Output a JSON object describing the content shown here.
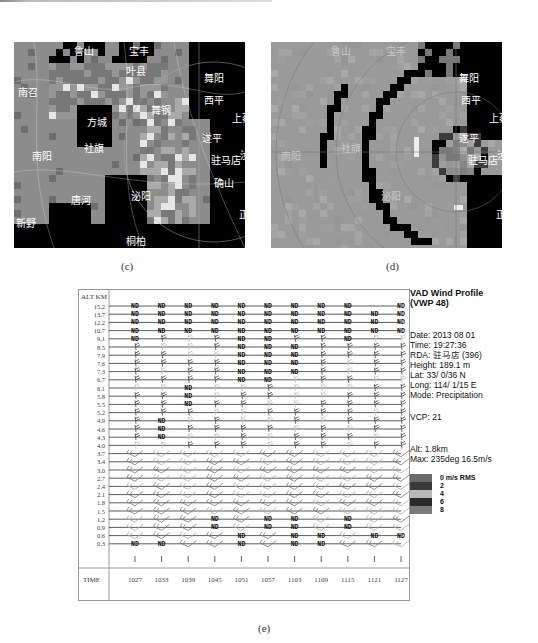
{
  "figure": {
    "panels": [
      {
        "id": "c",
        "caption": "(c)",
        "labels": [
          "鲁山",
          "宝丰",
          "叶县",
          "西平",
          "上蔡",
          "方城",
          "舞钢",
          "遂平",
          "驻马店",
          "汝南",
          "南阳",
          "社旗",
          "泌阳",
          "唐河",
          "确山",
          "正阳",
          "新野",
          "桐柏",
          "南召",
          "舞阳"
        ]
      },
      {
        "id": "d",
        "caption": "(d)",
        "labels": [
          "鲁山",
          "宝丰",
          "西平",
          "上蔡",
          "遂平",
          "驻马店",
          "汝南",
          "南阳",
          "社旗",
          "泌阳",
          "正阳",
          "舞阳"
        ]
      }
    ],
    "vwp": {
      "caption": "(e)",
      "alt_header": "ALT KM",
      "time_header": "TIME",
      "altitudes": [
        "15.2",
        "13.7",
        "12.2",
        "10.7",
        "9.1",
        "8.5",
        "7.9",
        "7.6",
        "7.3",
        "6.7",
        "6.1",
        "5.8",
        "5.5",
        "5.2",
        "4.9",
        "4.6",
        "4.3",
        "4.0",
        "3.7",
        "3.4",
        "3.0",
        "2.7",
        "2.4",
        "2.1",
        "1.8",
        "1.5",
        "1.2",
        "0.9",
        "0.6",
        "0.3"
      ],
      "times": [
        "1027",
        "1033",
        "1039",
        "1045",
        "1051",
        "1057",
        "1103",
        "1109",
        "1115",
        "1121",
        "1127"
      ],
      "nd_label": "ND",
      "nd_cells": {
        "15.2": [
          0,
          1,
          2,
          3,
          4,
          5,
          6,
          7,
          8,
          10
        ],
        "13.7": [
          0,
          1,
          2,
          3,
          4,
          5,
          6,
          7,
          8,
          9,
          10
        ],
        "12.2": [
          0,
          1,
          2,
          3,
          4,
          5,
          6,
          7,
          8,
          9,
          10
        ],
        "10.7": [
          0,
          1,
          2,
          3,
          4,
          5,
          6,
          7,
          8,
          9,
          10
        ],
        "9.1": [
          0,
          4,
          5,
          8
        ],
        "8.5": [
          4,
          5,
          6
        ],
        "7.9": [
          4,
          5,
          6
        ],
        "7.6": [
          4,
          5,
          6
        ],
        "7.3": [
          4,
          5,
          6
        ],
        "6.7": [
          4,
          5
        ],
        "6.1": [
          2
        ],
        "5.8": [
          2
        ],
        "5.5": [
          2
        ],
        "4.9": [
          1
        ],
        "4.6": [
          1
        ],
        "4.3": [
          1
        ],
        "1.2": [
          3,
          5,
          6,
          8
        ],
        "0.9": [
          3,
          5,
          6,
          8
        ],
        "0.6": [
          4,
          6,
          7,
          9,
          10
        ],
        "0.3": [
          0,
          1,
          4,
          6,
          7
        ]
      },
      "info": {
        "title_line1": "VAD Wind Profile",
        "title_line2": "(VWP 48)",
        "date": "Date: 2013 08 01",
        "time": "Time: 19:27:36",
        "rda": "RDA: 驻马店 (396)",
        "height": "Height: 189.1 m",
        "lat": "Lat:  33/ 0/36 N",
        "long": "Long: 114/ 1/15 E",
        "mode": "Mode: Precipitation",
        "vcp": "VCP: 21",
        "alt": "Alt: 1.8km",
        "max": "Max: 235deg 16.5m/s"
      },
      "legend": {
        "title": "0 m/s RMS",
        "items": [
          {
            "label": "0 m/s RMS",
            "color": "#6a6a6a"
          },
          {
            "label": "2",
            "color": "#3a3a3a"
          },
          {
            "label": "4",
            "color": "#b8b8b8"
          },
          {
            "label": "6",
            "color": "#2a2a2a"
          },
          {
            "label": "8",
            "color": "#7a7a7a"
          }
        ]
      }
    }
  }
}
